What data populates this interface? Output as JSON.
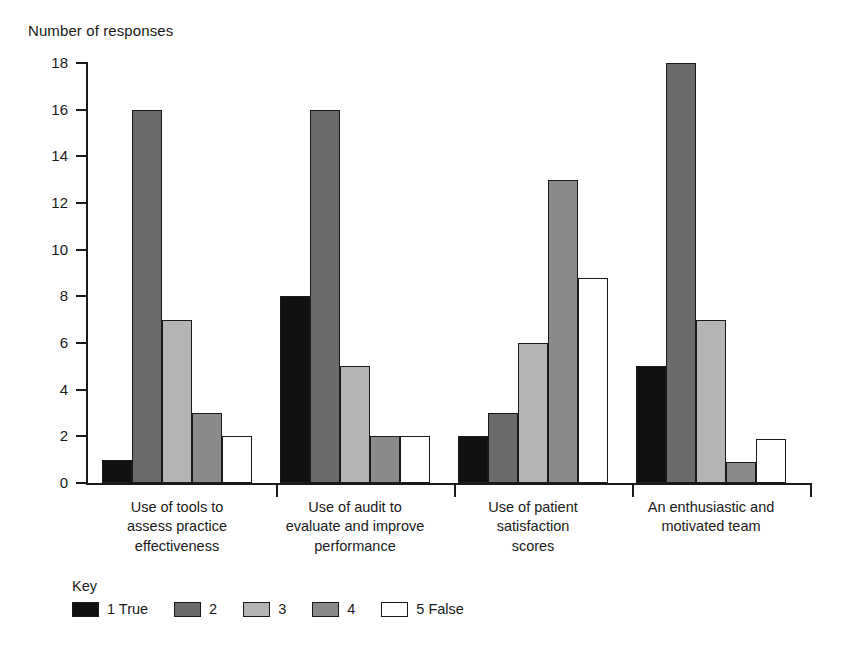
{
  "chart_data": {
    "type": "bar",
    "title": "",
    "ylabel": "Number of responses",
    "xlabel": "",
    "ylim": [
      0,
      18
    ],
    "ytick_step": 2,
    "yticks": [
      "0",
      "2",
      "4",
      "6",
      "8",
      "10",
      "12",
      "14",
      "16",
      "18"
    ],
    "grid": false,
    "legend_position": "bottom-left",
    "legend_title": "Key",
    "categories": [
      "Use of tools to assess practice effectiveness",
      "Use of audit to evaluate and improve performance",
      "Use of patient satisfaction scores",
      "An enthusiastic and motivated team"
    ],
    "category_lines": [
      [
        "Use of tools to",
        "assess practice",
        "effectiveness"
      ],
      [
        "Use of audit to",
        "evaluate and improve",
        "performance"
      ],
      [
        "Use of patient",
        "satisfaction",
        "scores"
      ],
      [
        "An enthusiastic and",
        "motivated team"
      ]
    ],
    "series": [
      {
        "name": "1 True",
        "color": "#111111",
        "values": [
          1,
          8,
          2,
          5
        ]
      },
      {
        "name": "2",
        "color": "#6b6b6b",
        "values": [
          16,
          16,
          3,
          18
        ]
      },
      {
        "name": "3",
        "color": "#b4b4b4",
        "values": [
          7,
          5,
          6,
          7
        ]
      },
      {
        "name": "4",
        "color": "#8a8a8a",
        "values": [
          3,
          2,
          13,
          0.9
        ]
      },
      {
        "name": "5 False",
        "color": "#ffffff",
        "values": [
          2,
          2,
          8.8,
          1.9
        ]
      }
    ]
  },
  "legend": {
    "title": "Key",
    "items": [
      {
        "label": "1 True",
        "color": "#111111"
      },
      {
        "label": "2",
        "color": "#6b6b6b"
      },
      {
        "label": "3",
        "color": "#b4b4b4"
      },
      {
        "label": "4",
        "color": "#8a8a8a"
      },
      {
        "label": "5 False",
        "color": "#ffffff"
      }
    ]
  },
  "axis": {
    "y_title": "Number of responses"
  }
}
